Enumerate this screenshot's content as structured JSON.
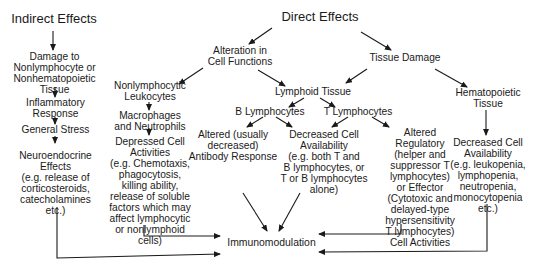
{
  "diagram": {
    "title_left": "Indirect Effects",
    "title_center": "Direct Effects",
    "indirect_chain": [
      "Damage to\nNonlymphocyte or\nNonhematopoietic\nTissue",
      "Inflammatory\nResponse",
      "General Stress",
      "Neuroendocrine\nEffects\n(e.g. release of\ncorticosteroids,\ncatecholamines\netc.)"
    ],
    "alteration": "Alteration in\nCell Functions",
    "tissue_damage": "Tissue Damage",
    "nonlymphocytic": {
      "header": "Nonlymphocytic\nLeukocytes",
      "macrophages": "Macrophages\nand Neutrophils",
      "depressed": "Depressed Cell\nActivities\n(e.g. Chemotaxis,\nphagocytosis,\nkilling ability,\nrelease of soluble\nfactors which may\naffect lymphocytic\nor nonlymphoid\ncells)"
    },
    "lymphoid": {
      "header": "Lymphoid Tissue",
      "b_lymphocytes": "B Lymphocytes",
      "t_lymphocytes": "T Lymphocytes",
      "altered_antibody": "Altered (usually\ndecreased)\nAntibody Response",
      "decreased_availability": "Decreased Cell\nAvailability\n(e.g. both T and\nB lymphocytes, or\nT or B lymphocytes\nalone)",
      "altered_regulatory": "Altered\nRegulatory\n(helper and\nsuppressor T\nlymphocytes)\nor Effector\n(Cytotoxic and\ndelayed-type\nhypersensitivity\nT lymphocytes)\nCell Activities"
    },
    "hematopoietic": {
      "header": "Hematopoietic\nTissue",
      "decreased": "Decreased Cell\nAvailability\n(e.g. leukopenia,\nlymphopenia,\nneutropenia,\nmonocytopenia\netc.)"
    },
    "outcome": "Immunomodulation",
    "line_color": "#1a1a1a"
  }
}
